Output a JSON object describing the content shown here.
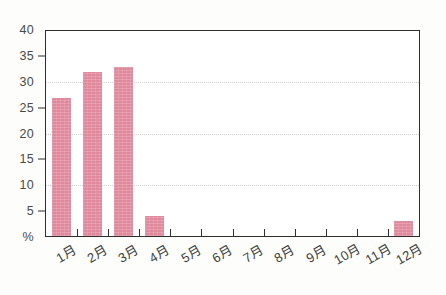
{
  "chart_data": {
    "type": "bar",
    "title": "",
    "subtitle": "",
    "xlabel": "",
    "ylabel": "%",
    "categories": [
      "1月",
      "2月",
      "3月",
      "4月",
      "5月",
      "6月",
      "7月",
      "8月",
      "9月",
      "10月",
      "11月",
      "12月"
    ],
    "values": [
      27,
      32,
      33,
      4,
      0,
      0,
      0,
      0,
      0,
      0,
      0,
      3
    ],
    "series": [
      {
        "name": "",
        "values": [
          27,
          32,
          33,
          4,
          0,
          0,
          0,
          0,
          0,
          0,
          0,
          3
        ]
      }
    ],
    "ylim": [
      0,
      40
    ],
    "y_ticks": [
      40,
      35,
      30,
      25,
      20,
      15,
      10,
      5
    ],
    "y_tick_labels": [
      "40",
      "35",
      "30",
      "25",
      "20",
      "15",
      "10",
      "5"
    ],
    "y_zero_label": "%",
    "y_gridline_values": [
      30,
      20,
      10
    ],
    "y_tickmark_values": [
      35,
      25,
      15,
      5
    ],
    "grid": true,
    "legend": false,
    "legend_position": "none",
    "bar_color": "#e0899c",
    "axis_color": "#2e2e2e",
    "grid_color": "#ccc6c8",
    "background_color": "#fdfdfc",
    "annotations": []
  }
}
